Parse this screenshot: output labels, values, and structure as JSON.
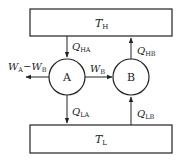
{
  "diagram": {
    "hot_reservoir": {
      "symbol": "T",
      "sub": "H"
    },
    "cold_reservoir": {
      "symbol": "T",
      "sub": "L"
    },
    "engine_a": {
      "label": "A"
    },
    "engine_b": {
      "label": "B"
    },
    "flows": {
      "q_ha": {
        "symbol": "Q",
        "sub": "HA",
        "direction": "down"
      },
      "q_hb": {
        "symbol": "Q",
        "sub": "HB",
        "direction": "up"
      },
      "q_la": {
        "symbol": "Q",
        "sub": "LA",
        "direction": "down"
      },
      "q_lb": {
        "symbol": "Q",
        "sub": "LB",
        "direction": "up"
      },
      "w_b": {
        "symbol": "W",
        "sub": "B",
        "direction": "right"
      },
      "w_net": {
        "symbol_1": "W",
        "sub_1": "A",
        "minus": "−",
        "symbol_2": "W",
        "sub_2": "B",
        "direction": "left"
      }
    },
    "colors": {
      "stroke": "#222222",
      "background": "#ffffff"
    }
  }
}
